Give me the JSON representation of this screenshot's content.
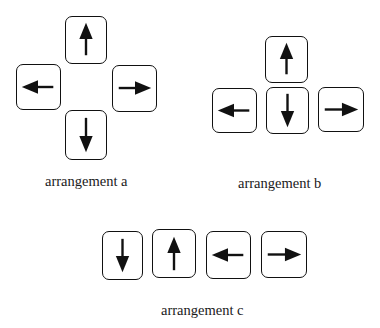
{
  "diagram": {
    "ink_color": "#111111",
    "background": "#ffffff",
    "arrangements": [
      {
        "id": "a",
        "label": "arrangement a",
        "layout": "cross",
        "keys": [
          {
            "direction": "up"
          },
          {
            "direction": "left"
          },
          {
            "direction": "right"
          },
          {
            "direction": "down"
          }
        ]
      },
      {
        "id": "b",
        "label": "arrangement b",
        "layout": "inverted-T",
        "keys": [
          {
            "direction": "up"
          },
          {
            "direction": "left"
          },
          {
            "direction": "down"
          },
          {
            "direction": "right"
          }
        ]
      },
      {
        "id": "c",
        "label": "arrangement c",
        "layout": "row",
        "keys": [
          {
            "direction": "down"
          },
          {
            "direction": "up"
          },
          {
            "direction": "left"
          },
          {
            "direction": "right"
          }
        ]
      }
    ]
  }
}
